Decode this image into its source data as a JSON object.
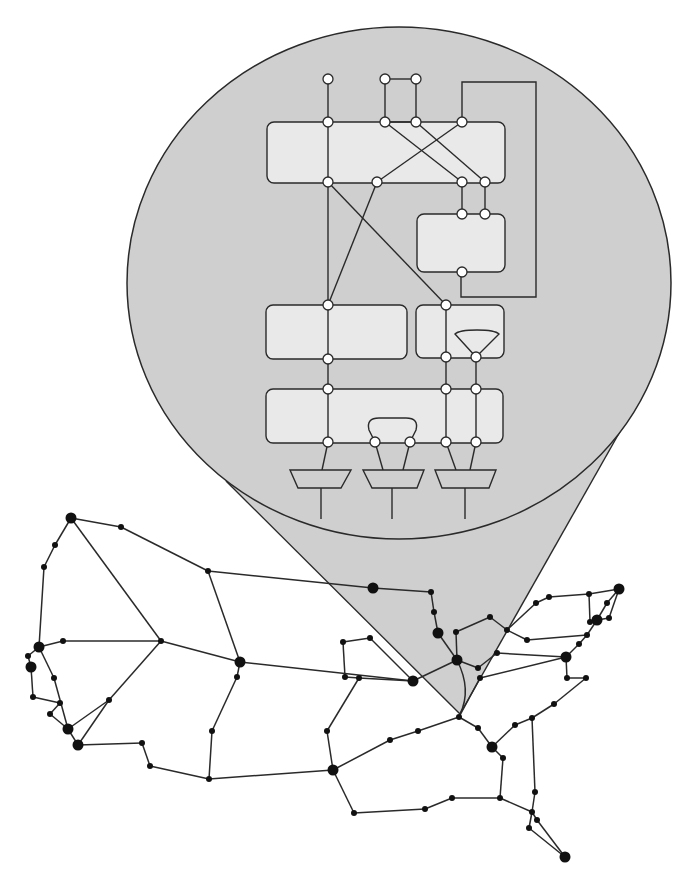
{
  "diagram": {
    "type": "zoom-callout",
    "colors": {
      "background": "#ffffff",
      "callout_fill": "#cfcfcf",
      "block_fill": "#e9e9e9",
      "stroke": "#2a2a2a",
      "port_fill": "#ffffff",
      "map_node": "#111111"
    }
  },
  "callout": {
    "ellipse": {
      "cx": 399,
      "cy": 283,
      "rx": 272,
      "ry": 256
    },
    "cone": {
      "apex": [
        460,
        714
      ],
      "left_tangent": [
        226,
        481
      ],
      "right_tangent": [
        622,
        428
      ]
    }
  },
  "inset": {
    "blocks": [
      {
        "id": "block-top",
        "x": 267,
        "y": 122,
        "w": 238,
        "h": 61
      },
      {
        "id": "block-right-upper",
        "x": 417,
        "y": 214,
        "w": 88,
        "h": 58
      },
      {
        "id": "block-mid-left",
        "x": 266,
        "y": 305,
        "w": 141,
        "h": 54
      },
      {
        "id": "block-mid-right",
        "x": 416,
        "y": 305,
        "w": 88,
        "h": 53
      },
      {
        "id": "block-bottom",
        "x": 266,
        "y": 389,
        "w": 237,
        "h": 54
      }
    ],
    "ports": [
      [
        328,
        79
      ],
      [
        385,
        79
      ],
      [
        416,
        79
      ],
      [
        328,
        122
      ],
      [
        385,
        122
      ],
      [
        416,
        122
      ],
      [
        462,
        122
      ],
      [
        328,
        182
      ],
      [
        377,
        182
      ],
      [
        462,
        182
      ],
      [
        485,
        182
      ],
      [
        462,
        214
      ],
      [
        485,
        214
      ],
      [
        462,
        272
      ],
      [
        328,
        305
      ],
      [
        446,
        305
      ],
      [
        328,
        359
      ],
      [
        446,
        357
      ],
      [
        476,
        357
      ],
      [
        328,
        389
      ],
      [
        446,
        389
      ],
      [
        476,
        389
      ],
      [
        328,
        442
      ],
      [
        375,
        442
      ],
      [
        410,
        442
      ],
      [
        446,
        442
      ],
      [
        476,
        442
      ]
    ],
    "wires": [
      [
        [
          328,
          79
        ],
        [
          328,
          442
        ]
      ],
      [
        [
          385,
          79
        ],
        [
          416,
          79
        ]
      ],
      [
        [
          385,
          79
        ],
        [
          385,
          122
        ]
      ],
      [
        [
          416,
          79
        ],
        [
          416,
          122
        ]
      ],
      [
        [
          385,
          122
        ],
        [
          416,
          122
        ]
      ],
      [
        [
          385,
          122
        ],
        [
          462,
          182
        ]
      ],
      [
        [
          416,
          122
        ],
        [
          485,
          182
        ]
      ],
      [
        [
          462,
          122
        ],
        [
          377,
          182
        ]
      ],
      [
        [
          462,
          182
        ],
        [
          462,
          214
        ]
      ],
      [
        [
          485,
          182
        ],
        [
          485,
          214
        ]
      ],
      [
        [
          328,
          182
        ],
        [
          446,
          305
        ]
      ],
      [
        [
          377,
          182
        ],
        [
          328,
          305
        ]
      ],
      [
        [
          446,
          305
        ],
        [
          446,
          442
        ]
      ],
      [
        [
          476,
          357
        ],
        [
          476,
          442
        ]
      ],
      [
        [
          328,
          442
        ],
        [
          322,
          470
        ]
      ],
      [
        [
          375,
          442
        ],
        [
          383,
          470
        ]
      ],
      [
        [
          410,
          442
        ],
        [
          403,
          470
        ]
      ],
      [
        [
          446,
          442
        ],
        [
          456,
          470
        ]
      ],
      [
        [
          476,
          442
        ],
        [
          470,
          470
        ]
      ],
      [
        [
          321,
          488
        ],
        [
          321,
          519
        ]
      ],
      [
        [
          392,
          488
        ],
        [
          392,
          519
        ]
      ],
      [
        [
          465,
          488
        ],
        [
          465,
          519
        ]
      ]
    ],
    "feedback_loop": [
      [
        462,
        122
      ],
      [
        462,
        82
      ],
      [
        536,
        82
      ],
      [
        536,
        297
      ],
      [
        461,
        297
      ],
      [
        461,
        272
      ]
    ],
    "mux_triangle": {
      "top_left": [
        455,
        333
      ],
      "top_right": [
        499,
        333
      ],
      "apex": [
        476,
        357
      ]
    },
    "loop_arc": {
      "left": [
        375,
        442
      ],
      "right": [
        410,
        442
      ],
      "top_y": 418
    },
    "muxes": [
      {
        "top": [
          290,
          351
        ],
        "bottom": [
          298,
          341
        ],
        "y_top": 470,
        "y_bottom": 488
      },
      {
        "top": [
          363,
          424
        ],
        "bottom": [
          372,
          417
        ],
        "y_top": 470,
        "y_bottom": 488
      },
      {
        "top": [
          435,
          496
        ],
        "bottom": [
          442,
          489
        ],
        "y_top": 470,
        "y_bottom": 488
      }
    ]
  },
  "map": {
    "nodes": {
      "A": [
        71,
        518,
        "L"
      ],
      "B": [
        121,
        527,
        "S"
      ],
      "C": [
        208,
        571,
        "S"
      ],
      "D": [
        55,
        545,
        "S"
      ],
      "E": [
        44,
        567,
        "S"
      ],
      "F": [
        39,
        647,
        "L"
      ],
      "G": [
        63,
        641,
        "S"
      ],
      "H": [
        161,
        641,
        "S"
      ],
      "I": [
        240,
        662,
        "L"
      ],
      "J": [
        28,
        656,
        "S"
      ],
      "K": [
        31,
        667,
        "L"
      ],
      "L1": [
        54,
        678,
        "S"
      ],
      "M": [
        237,
        677,
        "S"
      ],
      "N": [
        33,
        697,
        "S"
      ],
      "O": [
        109,
        700,
        "S"
      ],
      "P": [
        60,
        703,
        "S"
      ],
      "Q": [
        50,
        714,
        "S"
      ],
      "R": [
        68,
        729,
        "L"
      ],
      "S1": [
        78,
        745,
        "L"
      ],
      "T": [
        142,
        743,
        "S"
      ],
      "U": [
        150,
        766,
        "S"
      ],
      "V": [
        209,
        779,
        "S"
      ],
      "W": [
        212,
        731,
        "S"
      ],
      "X": [
        373,
        588,
        "L"
      ],
      "Y": [
        431,
        592,
        "S"
      ],
      "Z": [
        434,
        612,
        "S"
      ],
      "AA": [
        438,
        633,
        "L"
      ],
      "AB": [
        343,
        642,
        "S"
      ],
      "AC": [
        370,
        638,
        "S"
      ],
      "AD": [
        345,
        677,
        "S"
      ],
      "AE": [
        359,
        678,
        "S"
      ],
      "AF": [
        413,
        681,
        "L"
      ],
      "AG": [
        457,
        660,
        "L"
      ],
      "AR": [
        456,
        632,
        "S"
      ],
      "AH": [
        327,
        731,
        "S"
      ],
      "AI": [
        333,
        770,
        "L"
      ],
      "AJ": [
        390,
        740,
        "S"
      ],
      "AK": [
        418,
        731,
        "S"
      ],
      "APX": [
        459,
        717,
        "S"
      ],
      "AL": [
        478,
        728,
        "S"
      ],
      "AM": [
        492,
        747,
        "L"
      ],
      "AN": [
        354,
        813,
        "S"
      ],
      "AO": [
        425,
        809,
        "S"
      ],
      "AP": [
        452,
        798,
        "S"
      ],
      "AQ": [
        500,
        798,
        "S"
      ],
      "AS": [
        490,
        617,
        "S"
      ],
      "AT": [
        507,
        630,
        "S"
      ],
      "AU": [
        536,
        603,
        "S"
      ],
      "AV": [
        549,
        597,
        "S"
      ],
      "AW": [
        589,
        594,
        "S"
      ],
      "AX": [
        619,
        589,
        "L"
      ],
      "AY": [
        607,
        603,
        "S"
      ],
      "AZ": [
        597,
        620,
        "L"
      ],
      "BA": [
        590,
        622,
        "S"
      ],
      "BB": [
        609,
        618,
        "S"
      ],
      "BC": [
        587,
        635,
        "S"
      ],
      "BD": [
        527,
        640,
        "S"
      ],
      "BE": [
        579,
        644,
        "S"
      ],
      "BF": [
        566,
        657,
        "L"
      ],
      "BG": [
        497,
        653,
        "S"
      ],
      "BH": [
        478,
        668,
        "S"
      ],
      "BI": [
        480,
        678,
        "S"
      ],
      "BJ": [
        567,
        678,
        "S"
      ],
      "BK": [
        586,
        678,
        "S"
      ],
      "BL": [
        554,
        704,
        "S"
      ],
      "BM": [
        532,
        718,
        "S"
      ],
      "BN": [
        515,
        725,
        "S"
      ],
      "BO": [
        503,
        758,
        "S"
      ],
      "BP": [
        535,
        792,
        "S"
      ],
      "BQ": [
        532,
        812,
        "S"
      ],
      "BR": [
        537,
        820,
        "S"
      ],
      "BS": [
        529,
        828,
        "S"
      ],
      "BT": [
        565,
        857,
        "L"
      ]
    },
    "edges": [
      [
        "A",
        "B"
      ],
      [
        "B",
        "C"
      ],
      [
        "C",
        "X"
      ],
      [
        "A",
        "D"
      ],
      [
        "D",
        "E"
      ],
      [
        "E",
        "F"
      ],
      [
        "A",
        "H"
      ],
      [
        "F",
        "G"
      ],
      [
        "G",
        "H"
      ],
      [
        "H",
        "I"
      ],
      [
        "C",
        "I"
      ],
      [
        "H",
        "O"
      ],
      [
        "F",
        "J"
      ],
      [
        "J",
        "K"
      ],
      [
        "K",
        "N"
      ],
      [
        "N",
        "P"
      ],
      [
        "F",
        "L1"
      ],
      [
        "L1",
        "R"
      ],
      [
        "P",
        "Q"
      ],
      [
        "Q",
        "R"
      ],
      [
        "R",
        "O"
      ],
      [
        "O",
        "S1"
      ],
      [
        "R",
        "S1"
      ],
      [
        "S1",
        "T"
      ],
      [
        "T",
        "U"
      ],
      [
        "U",
        "V"
      ],
      [
        "V",
        "W"
      ],
      [
        "W",
        "M"
      ],
      [
        "M",
        "I"
      ],
      [
        "I",
        "AF"
      ],
      [
        "AE",
        "AF"
      ],
      [
        "X",
        "Y"
      ],
      [
        "Y",
        "Z"
      ],
      [
        "Z",
        "AA"
      ],
      [
        "AA",
        "AG"
      ],
      [
        "AB",
        "AC"
      ],
      [
        "AB",
        "AD"
      ],
      [
        "AC",
        "AF"
      ],
      [
        "AD",
        "AE"
      ],
      [
        "AE",
        "AH"
      ],
      [
        "AH",
        "AI"
      ],
      [
        "V",
        "AI"
      ],
      [
        "AI",
        "AJ"
      ],
      [
        "AJ",
        "AK"
      ],
      [
        "AK",
        "APX"
      ],
      [
        "AI",
        "AN"
      ],
      [
        "AN",
        "AO"
      ],
      [
        "AO",
        "AP"
      ],
      [
        "AP",
        "AQ"
      ],
      [
        "AF",
        "AG"
      ],
      [
        "AR",
        "AG"
      ],
      [
        "AR",
        "AS"
      ],
      [
        "AS",
        "AT"
      ],
      [
        "AG",
        "BH"
      ],
      [
        "BH",
        "BG"
      ],
      [
        "BG",
        "BF"
      ],
      [
        "APX",
        "AL"
      ],
      [
        "AL",
        "AM"
      ],
      [
        "AT",
        "AU"
      ],
      [
        "AU",
        "AV"
      ],
      [
        "AV",
        "AW"
      ],
      [
        "AW",
        "AX"
      ],
      [
        "AW",
        "BA"
      ],
      [
        "BA",
        "AZ"
      ],
      [
        "AZ",
        "AY"
      ],
      [
        "AY",
        "AX"
      ],
      [
        "AX",
        "BB"
      ],
      [
        "BB",
        "AZ"
      ],
      [
        "AT",
        "BD"
      ],
      [
        "BD",
        "BC"
      ],
      [
        "BC",
        "AZ"
      ],
      [
        "BC",
        "BE"
      ],
      [
        "BE",
        "BF"
      ],
      [
        "BF",
        "BJ"
      ],
      [
        "BJ",
        "BK"
      ],
      [
        "BK",
        "BL"
      ],
      [
        "BI",
        "BF"
      ],
      [
        "BL",
        "BM"
      ],
      [
        "BM",
        "BN"
      ],
      [
        "BN",
        "AM"
      ],
      [
        "AM",
        "BO"
      ],
      [
        "BO",
        "AQ"
      ],
      [
        "AQ",
        "BQ"
      ],
      [
        "BM",
        "BP"
      ],
      [
        "BP",
        "BQ"
      ],
      [
        "BQ",
        "BR"
      ],
      [
        "BQ",
        "BS"
      ],
      [
        "BS",
        "BT"
      ],
      [
        "BR",
        "BT"
      ],
      [
        "APX",
        "BI"
      ]
    ],
    "curved_edge": {
      "from": [
        457,
        660
      ],
      "ctrl": [
        472,
        690
      ],
      "to": [
        460,
        714
      ]
    }
  }
}
